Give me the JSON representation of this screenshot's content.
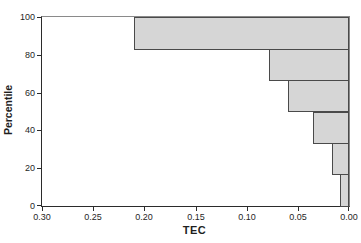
{
  "chart_data": {
    "type": "bar",
    "orientation": "horizontal",
    "title": "",
    "xlabel": "TEC",
    "ylabel": "Percentile",
    "x_axis": {
      "reversed": true,
      "left_value": 0.3,
      "right_value": 0.0,
      "ticks": [
        "0.30",
        "0.25",
        "0.20",
        "0.15",
        "0.10",
        "0.05",
        "0.00"
      ]
    },
    "y_axis": {
      "min": 0,
      "max": 100,
      "ticks": [
        "0",
        "20",
        "40",
        "60",
        "80",
        "100"
      ]
    },
    "bars": [
      {
        "percentile_from": 83.33,
        "percentile_to": 100,
        "tec": 0.21
      },
      {
        "percentile_from": 66.67,
        "percentile_to": 83.33,
        "tec": 0.078
      },
      {
        "percentile_from": 50,
        "percentile_to": 66.67,
        "tec": 0.06
      },
      {
        "percentile_from": 33.33,
        "percentile_to": 50,
        "tec": 0.035
      },
      {
        "percentile_from": 16.67,
        "percentile_to": 33.33,
        "tec": 0.017
      },
      {
        "percentile_from": 0,
        "percentile_to": 16.67,
        "tec": 0.009
      }
    ],
    "colors": {
      "bar_fill": "#d6d6d6",
      "bar_border": "#4a4a4a",
      "axis": "#2b2b2b",
      "frame": "#8a8a8a",
      "background": "#ffffff",
      "text": "#1f1f1f"
    },
    "legend": null,
    "grid": false
  }
}
